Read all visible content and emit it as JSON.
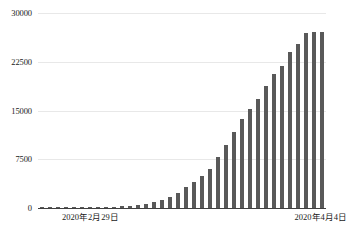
{
  "chart_data": {
    "type": "bar",
    "title": "",
    "subtitle": "",
    "xlabel": "",
    "ylabel": "",
    "ylim": [
      0,
      30000
    ],
    "yticks": [
      0,
      7500,
      15000,
      22500,
      30000
    ],
    "ytick_labels": [
      "0",
      "7500",
      "15000",
      "22500",
      "30000"
    ],
    "xtick_labels": [
      "2020年2月29日",
      "2020年4月4日"
    ],
    "grid": "horizontal",
    "legend": "none",
    "bar_color": "#595959",
    "categories": [
      "2020年2月29日",
      "2020年3月1日",
      "2020年3月2日",
      "2020年3月3日",
      "2020年3月4日",
      "2020年3月5日",
      "2020年3月6日",
      "2020年3月7日",
      "2020年3月8日",
      "2020年3月9日",
      "2020年3月10日",
      "2020年3月11日",
      "2020年3月12日",
      "2020年3月13日",
      "2020年3月14日",
      "2020年3月15日",
      "2020年3月16日",
      "2020年3月17日",
      "2020年3月18日",
      "2020年3月19日",
      "2020年3月20日",
      "2020年3月21日",
      "2020年3月22日",
      "2020年3月23日",
      "2020年3月24日",
      "2020年3月25日",
      "2020年3月26日",
      "2020年3月27日",
      "2020年3月28日",
      "2020年3月29日",
      "2020年3月30日",
      "2020年3月31日",
      "2020年4月1日",
      "2020年4月2日",
      "2020年4月3日",
      "2020年4月4日"
    ],
    "values": [
      10,
      20,
      30,
      40,
      50,
      60,
      80,
      100,
      130,
      170,
      230,
      320,
      430,
      600,
      900,
      1300,
      1750,
      2300,
      3100,
      4000,
      4900,
      5900,
      7900,
      9600,
      11700,
      13800,
      15300,
      18100,
      20500,
      22000,
      24000,
      25300,
      26800,
      400,
      1000,
      2700
    ],
    "bars": [
      {
        "value": 10
      },
      {
        "value": 25
      },
      {
        "value": 35
      },
      {
        "value": 45
      },
      {
        "value": 55
      },
      {
        "value": 70
      },
      {
        "value": 90
      },
      {
        "value": 110
      },
      {
        "value": 140
      },
      {
        "value": 180
      },
      {
        "value": 240
      },
      {
        "value": 330
      },
      {
        "value": 450
      },
      {
        "value": 620
      },
      {
        "value": 900
      },
      {
        "value": 1250
      },
      {
        "value": 1700
      },
      {
        "value": 2300
      },
      {
        "value": 3200
      },
      {
        "value": 4000
      },
      {
        "value": 4900
      },
      {
        "value": 5950
      },
      {
        "value": 7900
      },
      {
        "value": 9650
      },
      {
        "value": 11700
      },
      {
        "value": 13750
      },
      {
        "value": 15300
      },
      {
        "value": 16800
      },
      {
        "value": 18700
      },
      {
        "value": 20600
      },
      {
        "value": 21800
      },
      {
        "value": 24000
      },
      {
        "value": 25300
      },
      {
        "value": 26900
      },
      {
        "value": 27100
      },
      {
        "value": 27100
      }
    ]
  }
}
